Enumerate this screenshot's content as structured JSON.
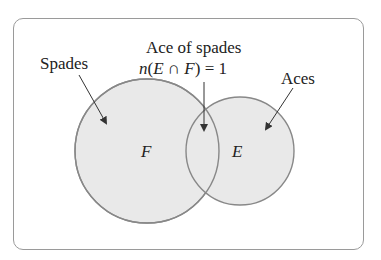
{
  "diagram": {
    "type": "venn",
    "colors": {
      "frame_border": "#9a9a9a",
      "circle_fill": "#e9e9e9",
      "circle_stroke": "#888888",
      "text": "#222222",
      "arrow": "#333333"
    },
    "sets": [
      {
        "id": "F",
        "symbol": "F",
        "label": "Spades"
      },
      {
        "id": "E",
        "symbol": "E",
        "label": "Aces"
      }
    ],
    "intersection": {
      "label_line1": "Ace of spades",
      "label_line2_prefix": "n(",
      "label_line2_E": "E",
      "label_line2_cap": " ∩ ",
      "label_line2_F": "F",
      "label_line2_suffix": ") = 1"
    }
  }
}
